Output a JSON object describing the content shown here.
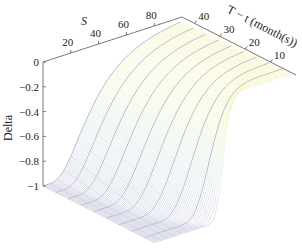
{
  "chart_data": {
    "type": "surface",
    "title": "",
    "xlabel": "S",
    "ylabel": "T − t (month(s))",
    "zlabel": "Delta",
    "x_ticks": [
      20,
      40,
      60,
      80
    ],
    "y_ticks": [
      10,
      20,
      30,
      40
    ],
    "z_ticks": [
      0,
      -0.2,
      -0.4,
      -0.6,
      -0.8,
      -1
    ],
    "z_tick_labels": [
      "0",
      "−0.2",
      "−0.4",
      "−0.6",
      "−0.8",
      "−1"
    ],
    "xlim": [
      0,
      100
    ],
    "ylim": [
      1,
      45
    ],
    "zlim": [
      -1,
      0
    ],
    "grid": false,
    "surface_description": "Put option Delta surface: Delta ≈ −1 for low S, rising smoothly to 0 for high S; transition sharpens as T − t approaches 0",
    "model": {
      "strike": 50,
      "rate": 0.05,
      "volatility": 0.3
    },
    "sample_points": [
      {
        "S": 0,
        "T_minus_t": 45,
        "Delta": -1
      },
      {
        "S": 50,
        "T_minus_t": 45,
        "Delta": -0.3
      },
      {
        "S": 100,
        "T_minus_t": 45,
        "Delta": -0.02
      },
      {
        "S": 0,
        "T_minus_t": 1,
        "Delta": -1
      },
      {
        "S": 50,
        "T_minus_t": 1,
        "Delta": -0.47
      },
      {
        "S": 100,
        "T_minus_t": 1,
        "Delta": 0
      }
    ],
    "colormap": [
      "#aeb2cf",
      "#c3d6e6",
      "#cfe9cf",
      "#eef3b8",
      "#f5f0b0"
    ]
  },
  "axes": {
    "s_label": "S",
    "t_label": "T − t (month(s))",
    "delta_label": "Delta"
  }
}
